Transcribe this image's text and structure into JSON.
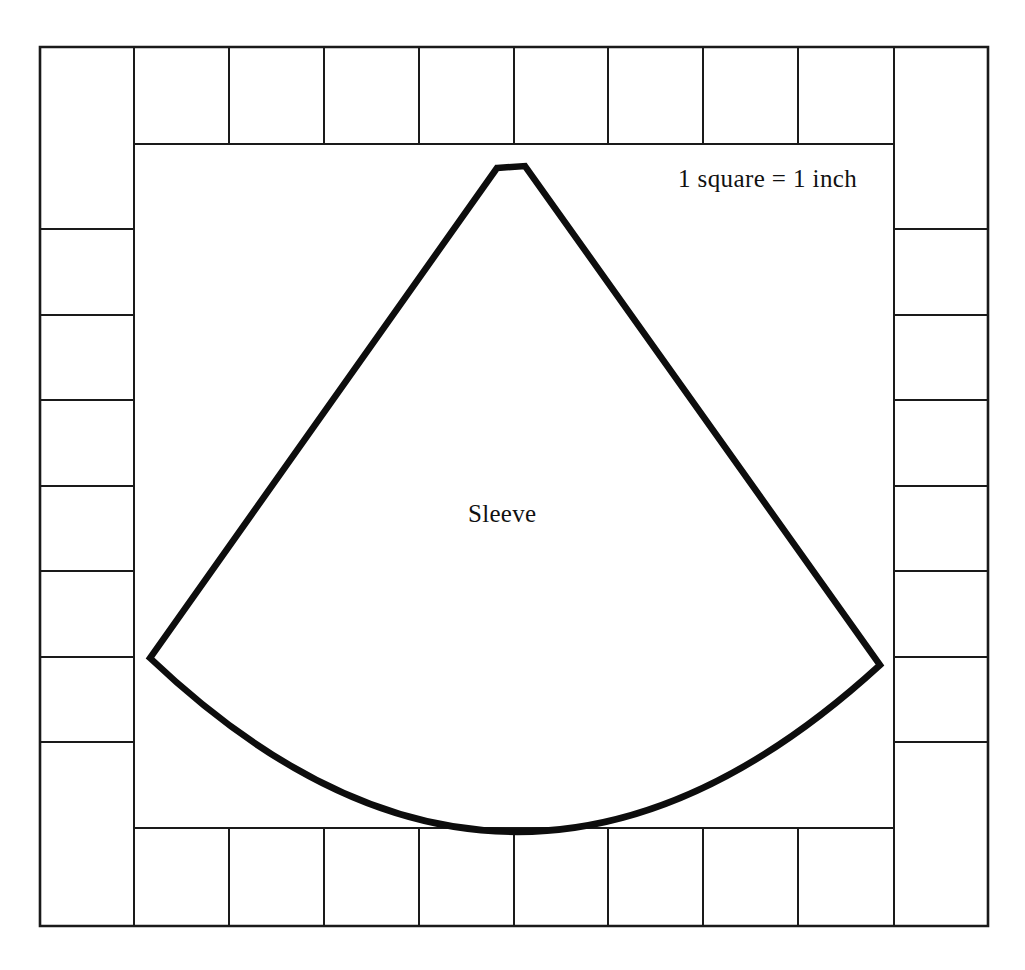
{
  "figure": {
    "kind": "sewing-pattern-grid-diagram",
    "background_color": "#ffffff",
    "line_color": "#1a1a1a",
    "outline_color": "#0d0d0d",
    "width": 1025,
    "height": 970
  },
  "labels": {
    "scale_note": "1 square = 1 inch",
    "piece_name": "Sleeve"
  },
  "grid": {
    "outer": {
      "left": 40,
      "top": 47,
      "right": 988,
      "bottom": 926
    },
    "inner": {
      "left": 134,
      "top": 144,
      "right": 894,
      "bottom": 828
    },
    "top_row": {
      "y_top": 47,
      "y_bottom": 144,
      "cell_count": 10,
      "x_dividers": [
        134,
        229,
        324,
        419,
        514,
        608,
        703,
        798,
        894
      ]
    },
    "bottom_row": {
      "y_top": 828,
      "y_bottom": 926,
      "cell_count": 10,
      "x_dividers": [
        134,
        229,
        324,
        419,
        514,
        608,
        703,
        798,
        894
      ]
    },
    "left_column": {
      "x_left": 40,
      "x_right": 134,
      "cell_count": 8,
      "y_dividers": [
        229,
        315,
        400,
        486,
        571,
        657,
        742
      ]
    },
    "right_column": {
      "x_left": 894,
      "x_right": 988,
      "cell_count": 8,
      "y_dividers": [
        229,
        315,
        400,
        486,
        571,
        657,
        742
      ]
    },
    "square_size_inches": 1
  },
  "sleeve_shape": {
    "apex_left": [
      497,
      168
    ],
    "apex_right": [
      525,
      166
    ],
    "corner_left": [
      150,
      658
    ],
    "corner_right": [
      880,
      665
    ],
    "hem_lowest_point": [
      510,
      806
    ],
    "path": "M 497 168 L 525 166 L 880 665 Q 512 1000 150 658 Z",
    "stroke_width": 6.5
  }
}
